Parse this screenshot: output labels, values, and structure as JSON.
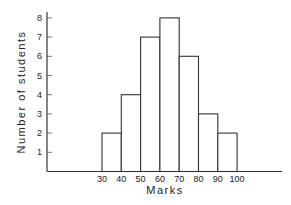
{
  "chart_data": {
    "type": "bar",
    "subtype": "histogram",
    "title": "",
    "xlabel": "Marks",
    "ylabel": "Number of students",
    "bin_edges": [
      30,
      40,
      50,
      60,
      70,
      80,
      90,
      100
    ],
    "categories": [
      "30-40",
      "40-50",
      "50-60",
      "60-70",
      "70-80",
      "80-90",
      "90-100"
    ],
    "values": [
      2,
      4,
      7,
      8,
      6,
      3,
      2
    ],
    "x_tick_labels": [
      "30",
      "40",
      "50",
      "60",
      "70",
      "80",
      "90",
      "100"
    ],
    "y_tick_labels": [
      "1",
      "2",
      "3",
      "4",
      "5",
      "6",
      "7",
      "8"
    ],
    "ylim": [
      0,
      8
    ],
    "grid": false,
    "legend": null,
    "colors": {
      "bar_fill": "#ffffff",
      "bar_stroke": "#333333",
      "axis": "#333333"
    }
  }
}
